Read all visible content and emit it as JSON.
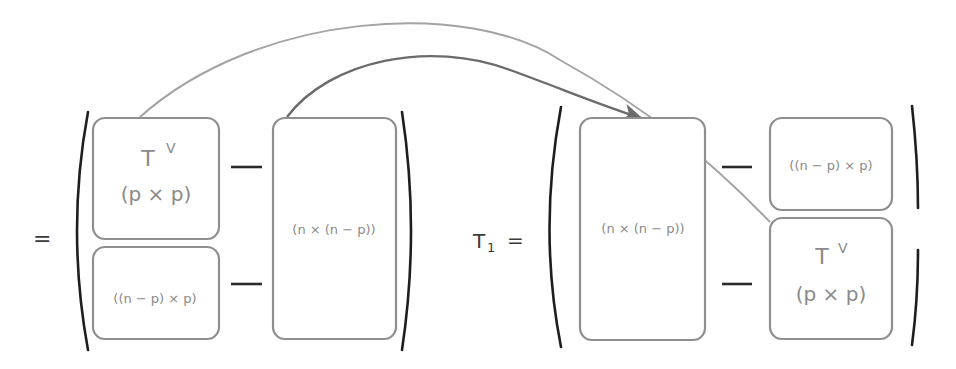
{
  "diagram": {
    "left_matrix": {
      "prefix": "=",
      "blocks": {
        "top_left": {
          "title": "T",
          "superscript": "V",
          "dims": "(p × p)"
        },
        "bottom_left": {
          "dims": "((n − p) × p)"
        },
        "right": {
          "dims": "(n × (n − p))"
        }
      },
      "separators": [
        "—",
        "—"
      ]
    },
    "right_matrix": {
      "prefix_main": "T",
      "prefix_sub": "1",
      "prefix_eq": "=",
      "blocks": {
        "left": {
          "dims": "(n × (n − p))"
        },
        "top_right": {
          "dims": "((n − p) × p)"
        },
        "bottom_right": {
          "title": "T",
          "superscript": "V",
          "dims": "(p × p)"
        }
      },
      "separators": [
        "—",
        "—"
      ]
    },
    "arrows": [
      {
        "from": "left_matrix.top_left",
        "to": "right_matrix.bottom_right",
        "style": "light-gray"
      },
      {
        "from": "left_matrix.right",
        "to": "right_matrix.left",
        "style": "dark-gray-arrowhead"
      }
    ],
    "colors": {
      "box_stroke": "#8f8f8f",
      "label_text": "#8a8a8a",
      "bracket": "#1e1e1e",
      "arc_light": "#a3a3a3",
      "arc_dark": "#6b6b6b"
    }
  }
}
